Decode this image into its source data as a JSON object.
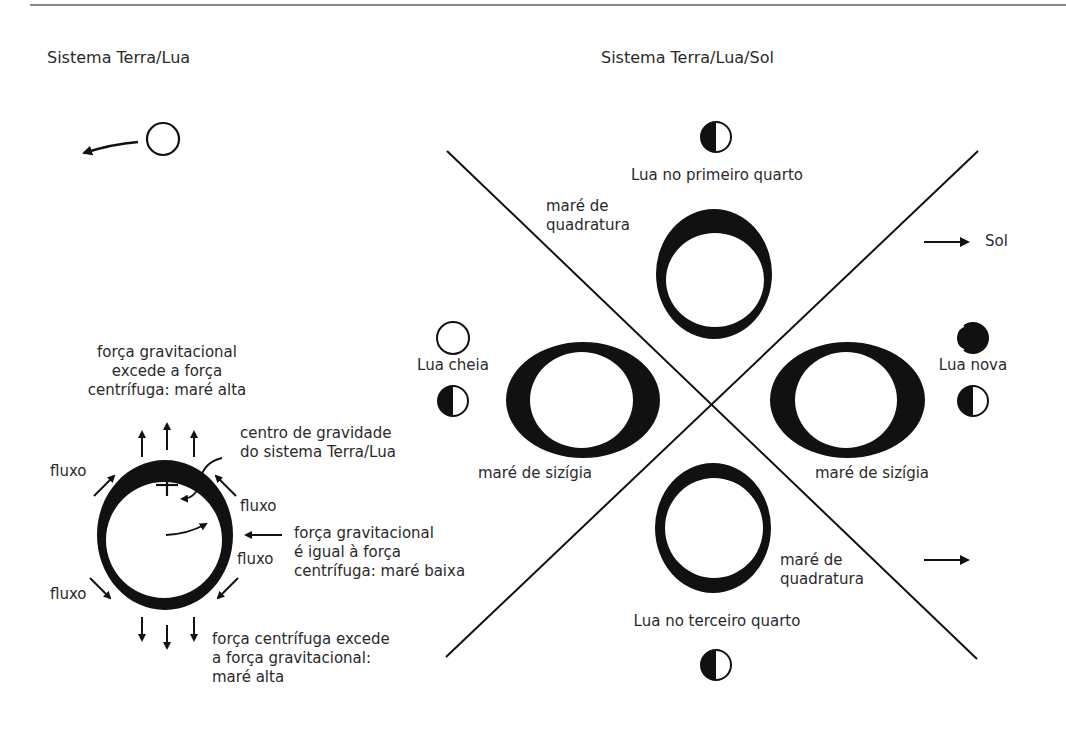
{
  "left_panel": {
    "title": "Sistema Terra/Lua",
    "labels": {
      "top_force": [
        "força gravitacional",
        "excede a força",
        "centrífuga: maré alta"
      ],
      "center_gravity": [
        "centro de gravidade",
        "do sistema Terra/Lua"
      ],
      "side_force": [
        "força gravitacional",
        "é igual à força",
        "centrífuga: maré baixa"
      ],
      "bottom_force": [
        "força centrífuga excede",
        "a força gravitacional:",
        "maré alta"
      ],
      "flow_upper_left": "fluxo",
      "flow_upper_right": "fluxo",
      "flow_right": "fluxo",
      "flow_lower_left": "fluxo"
    },
    "icons": [
      "moon-circle-icon",
      "arrow-left-icon",
      "earth-ring-icon",
      "center-plus-icon"
    ]
  },
  "right_panel": {
    "title": "Sistema Terra/Lua/Sol",
    "labels": {
      "first_quarter": "Lua no primeiro quarto",
      "third_quarter": "Lua no terceiro quarto",
      "full_moon": "Lua cheia",
      "new_moon": "Lua nova",
      "sun": "Sol",
      "neap_top": [
        "maré de",
        "quadratura"
      ],
      "neap_bottom": [
        "maré de",
        "quadratura"
      ],
      "spring_left": "maré de sizígia",
      "spring_right": "maré de sizígia"
    },
    "icons": [
      "half-moon-icon",
      "full-moon-icon",
      "new-moon-icon",
      "arrow-right-icon",
      "tidal-bulge-icon"
    ]
  },
  "colors": {
    "ink": "#111111",
    "text": "#2a2a2a",
    "rule": "#8a8a8a"
  }
}
